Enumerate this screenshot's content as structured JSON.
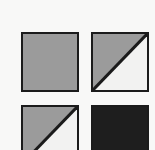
{
  "canvas": {
    "name": "tile-pattern-swatch-sheet",
    "width": 155,
    "height": 150,
    "background_color": "#f8f8f7",
    "border_color": "#1b1b1b",
    "border_width": 2,
    "columns": 2,
    "rows": 2,
    "note": "Bottom row of swatches is cropped by the lower image edge"
  },
  "palette": {
    "gray": "#9b9b9b",
    "light": "#f2f2f1",
    "dark": "#1e1e1e",
    "outline": "#1b1b1b",
    "background": "#f8f8f7"
  },
  "swatches": [
    {
      "id": "swatch-1",
      "position": "top-left",
      "pattern": "solid",
      "label": "Solid Gray",
      "fill_color": "#9b9b9b",
      "secondary_color": "",
      "diagonal": "none"
    },
    {
      "id": "swatch-2",
      "position": "top-right",
      "pattern": "half-diagonal",
      "label": "Half Diagonal Gray",
      "fill_color": "#9b9b9b",
      "secondary_color": "#f2f2f1",
      "diagonal": "bottom-left-to-top-right"
    },
    {
      "id": "swatch-3",
      "position": "bottom-left",
      "pattern": "half-diagonal",
      "label": "Half Diagonal Gray",
      "fill_color": "#9b9b9b",
      "secondary_color": "#f2f2f1",
      "diagonal": "bottom-left-to-top-right"
    },
    {
      "id": "swatch-4",
      "position": "bottom-right",
      "pattern": "solid",
      "label": "Solid Black",
      "fill_color": "#1e1e1e",
      "secondary_color": "",
      "diagonal": "none"
    }
  ]
}
